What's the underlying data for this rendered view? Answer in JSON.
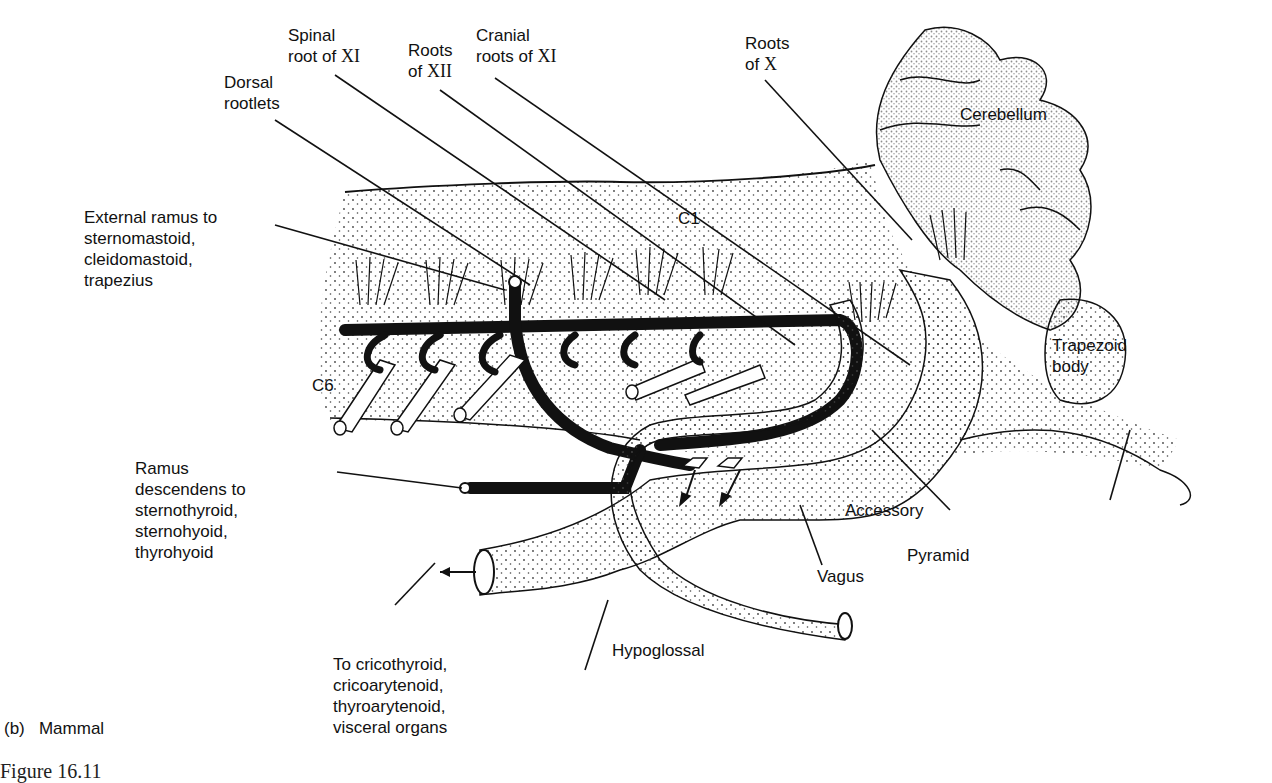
{
  "figure": {
    "panel_caption": "(b)   Mammal",
    "figure_label_partial": "Figure 16.11"
  },
  "labels": {
    "spinal_root_xi": {
      "line1": "Spinal",
      "line2_prefix": "root of ",
      "roman": "XI"
    },
    "roots_xii": {
      "line1": "Roots",
      "line2_prefix": "of ",
      "roman": "XII"
    },
    "cranial_roots_xi": {
      "line1": "Cranial",
      "line2_prefix": "roots of ",
      "roman": "XI"
    },
    "roots_x": {
      "line1": "Roots",
      "line2_prefix": "of ",
      "roman": "X"
    },
    "dorsal_rootlets": "Dorsal\nrootlets",
    "cerebellum": "Cerebellum",
    "external_ramus": "External ramus to\nsternomastoid,\ncleidomastoid,\ntrapezius",
    "c1": "C1",
    "c6": "C6",
    "trapezoid_body": "Trapezoid\nbody",
    "ramus_descendens": "Ramus\ndescendens to\nsternothyroid,\nsternohyoid,\nthyrohyoid",
    "accessory": "Accessory",
    "pyramid": "Pyramid",
    "vagus": "Vagus",
    "hypoglossal": "Hypoglossal",
    "to_cricothyroid": "To cricothyroid,\ncricoarytenoid,\nthyroarytenoid,\nvisceral organs"
  },
  "colors": {
    "ink": "#111111",
    "stipple": "#555555",
    "background": "#ffffff"
  }
}
